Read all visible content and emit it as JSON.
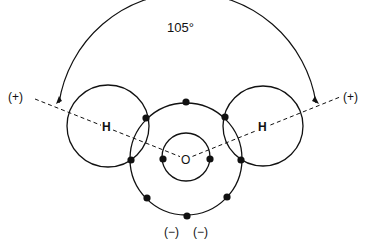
{
  "diagram": {
    "angle_label": "105°",
    "left_charge": "(+)",
    "right_charge": "(+)",
    "left_atom": "H",
    "right_atom": "H",
    "center_atom": "O",
    "bottom_charge_1": "(−)",
    "bottom_charge_2": "(−)",
    "colors": {
      "line": "#111111",
      "background": "#ffffff"
    }
  }
}
